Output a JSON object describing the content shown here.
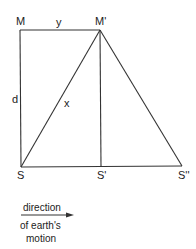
{
  "diagram": {
    "points": {
      "M": {
        "label": "M",
        "x": 20,
        "y": 30
      },
      "M_prime": {
        "label": "M'",
        "x": 100,
        "y": 30
      },
      "S": {
        "label": "S",
        "x": 21,
        "y": 167
      },
      "S_prime": {
        "label": "S'",
        "x": 101,
        "y": 167
      },
      "S_double_prime": {
        "label": "S''",
        "x": 182,
        "y": 167
      }
    },
    "segment_labels": {
      "y": "y",
      "d": "d",
      "x": "x"
    },
    "caption": {
      "line1": "direction",
      "line2": "of earth's",
      "line3": "motion"
    },
    "colors": {
      "stroke": "#333333",
      "text": "#222222"
    }
  }
}
